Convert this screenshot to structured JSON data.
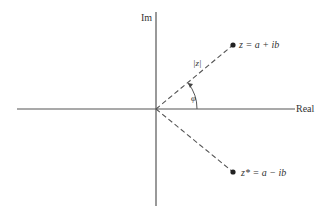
{
  "diagram": {
    "axes": {
      "horizontal_label": "Real",
      "vertical_label": "Im"
    },
    "points": [
      {
        "id": "z",
        "label": "z = a + ib",
        "quadrant": "upper-right"
      },
      {
        "id": "z_conj",
        "label": "z* = a − ib",
        "quadrant": "lower-right"
      }
    ],
    "annotations": {
      "modulus_label": "|z|",
      "angle_label": "φ"
    },
    "colors": {
      "line": "#555555",
      "text": "#333333",
      "point": "#222222"
    }
  }
}
